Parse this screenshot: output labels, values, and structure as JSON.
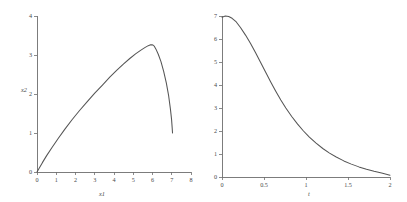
{
  "figure": {
    "background": "#ffffff",
    "curve_color": "#555555",
    "axis_color": "#6e6e6e",
    "text_color": "#4a4a4a"
  },
  "chart_data": [
    {
      "type": "line",
      "title": "",
      "subtitle": "",
      "xlabel": "x1",
      "ylabel": "x2",
      "xlim": [
        0,
        8
      ],
      "ylim": [
        0,
        4
      ],
      "xticks": [
        0,
        1,
        2,
        3,
        4,
        5,
        6,
        7,
        8
      ],
      "xticklabels": [
        "0",
        "1",
        "2",
        "3",
        "4",
        "5",
        "6",
        "7",
        "8"
      ],
      "yticks": [
        0,
        1,
        2,
        3,
        4
      ],
      "yticklabels": [
        "0",
        "1",
        "2",
        "3",
        "4"
      ],
      "grid": false,
      "legend": false,
      "legend_position": "none",
      "series": [
        {
          "name": "trajectory",
          "x": [
            0.0,
            0.12,
            0.28,
            0.5,
            0.78,
            1.1,
            1.45,
            1.82,
            2.2,
            2.6,
            3.0,
            3.4,
            3.78,
            4.15,
            4.5,
            4.82,
            5.12,
            5.38,
            5.6,
            5.78,
            5.9,
            5.98,
            6.04,
            6.1,
            6.18,
            6.3,
            6.44,
            6.58,
            6.72,
            6.84,
            6.93,
            6.99,
            7.02,
            7.04
          ],
          "y": [
            0.0,
            0.1,
            0.24,
            0.42,
            0.63,
            0.86,
            1.1,
            1.34,
            1.57,
            1.8,
            2.02,
            2.23,
            2.43,
            2.61,
            2.77,
            2.91,
            3.03,
            3.12,
            3.19,
            3.24,
            3.26,
            3.26,
            3.25,
            3.22,
            3.15,
            3.02,
            2.83,
            2.58,
            2.28,
            1.95,
            1.62,
            1.35,
            1.15,
            1.0
          ]
        }
      ]
    },
    {
      "type": "line",
      "title": "",
      "subtitle": "",
      "xlabel": "t",
      "ylabel": "",
      "xlim": [
        0,
        2
      ],
      "ylim": [
        0,
        7
      ],
      "xticks": [
        0,
        0.5,
        1,
        1.5,
        2
      ],
      "xticklabels": [
        "0",
        "0.5",
        "1",
        "1.5",
        "2"
      ],
      "yticks": [
        0,
        1,
        2,
        3,
        4,
        5,
        6,
        7
      ],
      "yticklabels": [
        "0",
        "1",
        "2",
        "3",
        "4",
        "5",
        "6",
        "7"
      ],
      "grid": false,
      "legend": false,
      "legend_position": "none",
      "series": [
        {
          "name": "decay",
          "x": [
            0.0,
            0.04,
            0.08,
            0.12,
            0.17,
            0.22,
            0.28,
            0.34,
            0.4,
            0.46,
            0.52,
            0.58,
            0.64,
            0.7,
            0.76,
            0.83,
            0.9,
            0.97,
            1.04,
            1.12,
            1.2,
            1.28,
            1.36,
            1.45,
            1.54,
            1.63,
            1.72,
            1.81,
            1.9,
            2.0
          ],
          "y": [
            6.95,
            7.0,
            6.98,
            6.9,
            6.74,
            6.5,
            6.17,
            5.8,
            5.4,
            4.98,
            4.55,
            4.13,
            3.73,
            3.35,
            3.0,
            2.63,
            2.3,
            2.0,
            1.73,
            1.47,
            1.24,
            1.04,
            0.87,
            0.7,
            0.56,
            0.44,
            0.34,
            0.25,
            0.17,
            0.08
          ]
        }
      ]
    }
  ]
}
